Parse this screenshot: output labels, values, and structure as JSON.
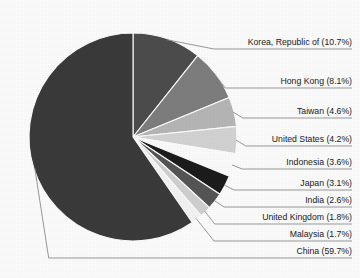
{
  "chart_data": {
    "type": "pie",
    "title": "",
    "subtitle": "",
    "xlabel": "",
    "ylabel": "",
    "legend_position": "none",
    "grid": false,
    "start_angle_deg": 0,
    "direction": "clockwise",
    "unit": "%",
    "categories": [
      "Korea, Republic of",
      "Hong Kong",
      "Taiwan",
      "United States",
      "Indonesia",
      "Japan",
      "India",
      "United Kingdom",
      "Malaysia",
      "China"
    ],
    "values": [
      10.7,
      8.1,
      4.6,
      4.2,
      3.6,
      3.1,
      2.6,
      1.8,
      1.7,
      59.7
    ],
    "labels": [
      "Korea, Republic of (10.7%)",
      "Hong Kong (8.1%)",
      "Taiwan (4.6%)",
      "United States (4.2%)",
      "Indonesia (3.6%)",
      "Japan (3.1%)",
      "India (2.6%)",
      "United Kingdom (1.8%)",
      "Malaysia (1.7%)",
      "China (59.7%)"
    ],
    "colors": [
      "#4c4c4c",
      "#7d7d7d",
      "#b5b5b5",
      "#d2d2d2",
      "#fafafa",
      "#1c1c1c",
      "#555555",
      "#cfcfcf",
      "#f2f2f2",
      "#3a3a3a"
    ],
    "slice_label_y": [
      45,
      84,
      114,
      142,
      165,
      186,
      203,
      220,
      237,
      254
    ],
    "background_color": "#fbfbfb",
    "leader_line_color": "#8d8d8d",
    "label_text_color": "#1a1a1a",
    "center_x": 133,
    "center_y": 137,
    "radius": 104,
    "label_right_x": 352
  }
}
